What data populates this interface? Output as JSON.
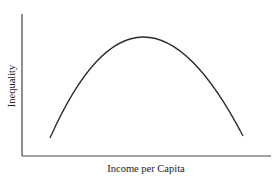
{
  "chart_data": {
    "type": "line",
    "title": "",
    "xlabel": "Income per Capita",
    "ylabel": "Inequality",
    "grid": false,
    "legend": null,
    "ticks": {
      "x": [],
      "y": []
    },
    "series": [
      {
        "name": "Kuznets curve",
        "shape": "inverted-U",
        "points_px": [
          [
            50,
            138
          ],
          [
            143,
            37
          ],
          [
            243,
            136
          ]
        ]
      }
    ],
    "axis_px": {
      "origin": [
        22,
        156
      ],
      "y_top": 14,
      "x_right": 271
    }
  }
}
